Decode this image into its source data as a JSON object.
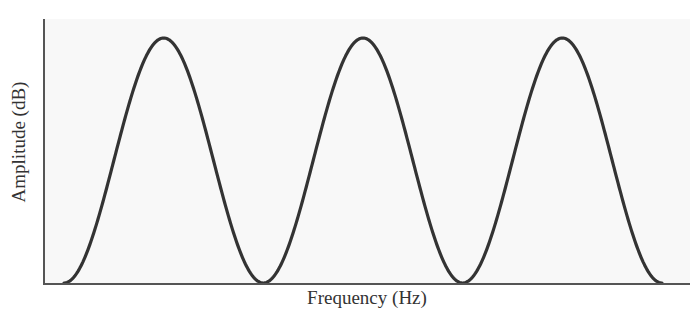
{
  "chart_data": {
    "type": "line",
    "title": "",
    "xlabel": "Frequency (Hz)",
    "ylabel": "Amplitude (dB)",
    "grid": false,
    "legend": null,
    "x_ticks": [],
    "y_ticks": [],
    "series": [
      {
        "name": "response",
        "color": "#333333",
        "x": [
          0,
          0.5,
          1,
          1.5,
          2,
          2.5,
          3
        ],
        "values": [
          0,
          1,
          0,
          1,
          0,
          1,
          0
        ]
      }
    ],
    "peaks_x": [
      0.5,
      1.5,
      2.5
    ],
    "nulls_x": [
      0,
      1,
      2,
      3
    ],
    "ylim": [
      0,
      1.08
    ],
    "xlim": [
      -0.1,
      3.15
    ]
  },
  "colors": {
    "axis": "#555555",
    "curve": "#333333",
    "background": "#ffffff",
    "plot_bg": "#f7f7f7"
  }
}
